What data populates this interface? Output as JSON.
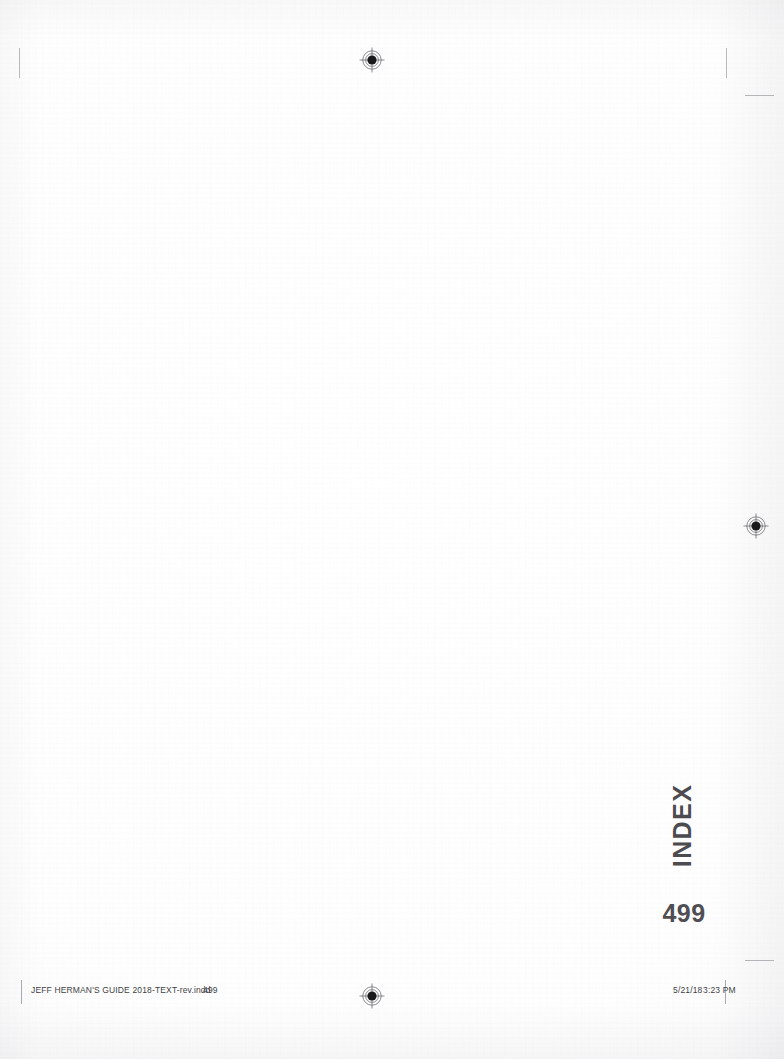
{
  "document": {
    "page_label": "499",
    "section_running_head": "INDEX",
    "background_color": "#ffffff",
    "ink_color": "#4b4b50",
    "slug_color": "#3f3f44"
  },
  "running_head": {
    "text": "INDEX"
  },
  "folio": {
    "page_number": "499"
  },
  "slug": {
    "file_name": "JEFF HERMAN'S GUIDE 2018-TEXT-rev.indd",
    "file_page": "499",
    "date": "5/21/18",
    "time": "3:23 PM"
  },
  "print_marks": {
    "registration_marks": [
      {
        "name": "registration-mark-top-center",
        "x": 359,
        "y": 47
      },
      {
        "name": "registration-mark-right-middle",
        "x": 743,
        "y": 513
      },
      {
        "name": "registration-mark-bottom-center",
        "x": 359,
        "y": 983
      }
    ],
    "crop_marks": [
      {
        "name": "crop-mark-top-left-vertical",
        "x": 19,
        "y": 48,
        "length": 30,
        "orientation": "vertical"
      },
      {
        "name": "crop-mark-top-right-vertical",
        "x": 726,
        "y": 48,
        "length": 30,
        "orientation": "vertical"
      },
      {
        "name": "crop-mark-top-right-horizontal",
        "x": 745,
        "y": 95,
        "length": 29,
        "orientation": "horizontal"
      },
      {
        "name": "crop-mark-bottom-right-horizontal",
        "x": 745,
        "y": 960,
        "length": 29,
        "orientation": "horizontal"
      }
    ]
  }
}
